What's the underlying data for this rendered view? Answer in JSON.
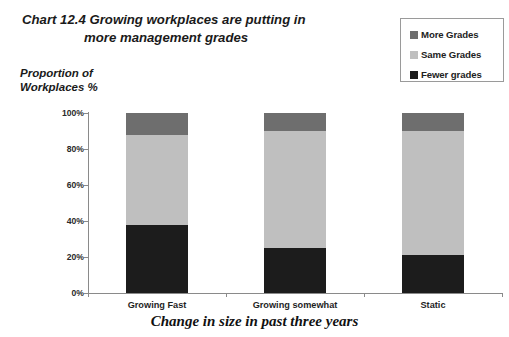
{
  "title": {
    "line1": "Chart 12.4  Growing workplaces are putting in",
    "line2": "more management grades"
  },
  "y_axis_title": {
    "line1": "Proportion of",
    "line2": "Workplaces %"
  },
  "x_axis_title": "Change in size in past three years",
  "legend": {
    "items": [
      {
        "label": "More Grades",
        "color": "#6e6e6e",
        "swatch_name": "legend-swatch-more-grades"
      },
      {
        "label": "Same Grades",
        "color": "#bfbfbf",
        "swatch_name": "legend-swatch-same-grades"
      },
      {
        "label": "Fewer grades",
        "color": "#1c1c1c",
        "swatch_name": "legend-swatch-fewer-grades"
      }
    ]
  },
  "y_ticks": [
    "0%",
    "20%",
    "40%",
    "60%",
    "80%",
    "100%"
  ],
  "chart_data": {
    "type": "bar",
    "subtype": "stacked-100-percent",
    "title": "Chart 12.4  Growing workplaces are putting in more management grades",
    "xlabel": "Change in size in past three years",
    "ylabel": "Proportion of Workplaces %",
    "ylim": [
      0,
      100
    ],
    "ytick_values": [
      0,
      20,
      40,
      60,
      80,
      100
    ],
    "ytick_labels": [
      "0%",
      "20%",
      "40%",
      "60%",
      "80%",
      "100%"
    ],
    "grid": false,
    "legend_position": "top-right",
    "categories": [
      "Growing Fast",
      "Growing somewhat",
      "Static"
    ],
    "series": [
      {
        "name": "Fewer grades",
        "color": "#1c1c1c",
        "values": [
          38,
          25,
          21
        ]
      },
      {
        "name": "Same Grades",
        "color": "#bfbfbf",
        "values": [
          50,
          65,
          69
        ]
      },
      {
        "name": "More Grades",
        "color": "#6e6e6e",
        "values": [
          12,
          10,
          10
        ]
      }
    ],
    "stack_order_bottom_to_top": [
      "Fewer grades",
      "Same Grades",
      "More Grades"
    ]
  }
}
